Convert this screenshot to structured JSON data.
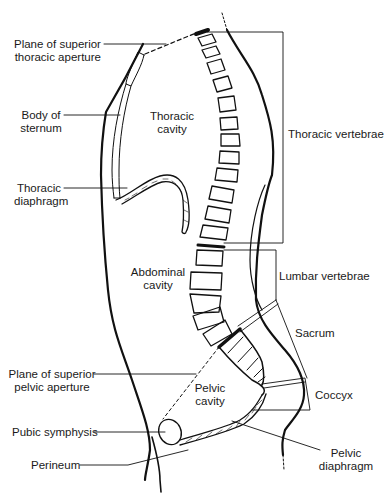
{
  "figure": {
    "colors": {
      "line": "#111111",
      "background": "#ffffff",
      "text": "#1a1a1a"
    }
  },
  "labels": {
    "plane_superior_thoracic_aperture": {
      "line1": "Plane of superior",
      "line2": "thoracic aperture"
    },
    "body_of_sternum": {
      "line1": "Body of",
      "line2": "sternum"
    },
    "thoracic_cavity": {
      "line1": "Thoracic",
      "line2": "cavity"
    },
    "thoracic_diaphragm": {
      "line1": "Thoracic",
      "line2": "diaphragm"
    },
    "thoracic_vertebrae": "Thoracic vertebrae",
    "abdominal_cavity": {
      "line1": "Abdominal",
      "line2": "cavity"
    },
    "lumbar_vertebrae": "Lumbar vertebrae",
    "sacrum": "Sacrum",
    "plane_superior_pelvic_aperture": {
      "line1": "Plane of superior",
      "line2": "pelvic aperture"
    },
    "pelvic_cavity": {
      "line1": "Pelvic",
      "line2": "cavity"
    },
    "coccyx": "Coccyx",
    "pubic_symphysis": "Pubic symphysis",
    "pelvic_diaphragm": {
      "line1": "Pelvic",
      "line2": "diaphragm"
    },
    "perineum": "Perineum"
  }
}
